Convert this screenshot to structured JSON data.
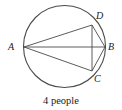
{
  "figure": {
    "caption": "4 people",
    "stroke_color": "#4a4a4a",
    "text_color": "#1a1a1a",
    "background_color": "#ffffff",
    "circle": {
      "center_x": 64.5,
      "center_y": 46.5,
      "radius": 41
    },
    "points": [
      {
        "id": "A",
        "label": "A",
        "x": 24,
        "y": 47,
        "label_x": 10,
        "label_y": 42
      },
      {
        "id": "B",
        "label": "B",
        "x": 105,
        "y": 47,
        "label_x": 108,
        "label_y": 43
      },
      {
        "id": "C",
        "label": "C",
        "x": 92,
        "y": 71,
        "label_x": 94,
        "label_y": 75
      },
      {
        "id": "D",
        "label": "D",
        "x": 92,
        "y": 25,
        "label_x": 96,
        "label_y": 12
      }
    ],
    "chords": [
      {
        "id": "AD",
        "from": "A",
        "to": "D"
      },
      {
        "id": "AB",
        "from": "A",
        "to": "B"
      },
      {
        "id": "AC",
        "from": "A",
        "to": "C"
      },
      {
        "id": "DB",
        "from": "D",
        "to": "B"
      },
      {
        "id": "BC",
        "from": "B",
        "to": "C"
      },
      {
        "id": "DC",
        "from": "D",
        "to": "C"
      }
    ]
  }
}
